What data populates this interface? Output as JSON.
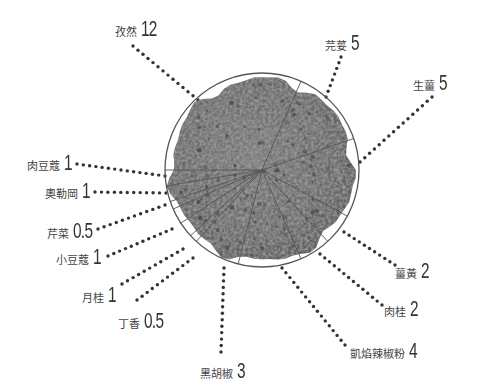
{
  "chart_data": {
    "type": "pie",
    "title": "",
    "center": [
      262,
      170
    ],
    "radius": 97,
    "start_angle_deg": 180,
    "direction": "clockwise",
    "colors": {
      "pile": "#6e6e6e",
      "pile_dark": "#4a4a4a",
      "pile_light": "#9a9a9a",
      "rim": "#555555",
      "dots": "#333333",
      "text": "#333333"
    },
    "slices": [
      {
        "name": "孜然",
        "value": 12,
        "value_label": "12"
      },
      {
        "name": "芫荽",
        "value": 5,
        "value_label": "5"
      },
      {
        "name": "生薑",
        "value": 5,
        "value_label": "5"
      },
      {
        "name": "薑黃",
        "value": 2,
        "value_label": "2"
      },
      {
        "name": "肉桂",
        "value": 2,
        "value_label": "2"
      },
      {
        "name": "凱焰辣椒粉",
        "value": 4,
        "value_label": "4"
      },
      {
        "name": "黑胡椒",
        "value": 3,
        "value_label": "3"
      },
      {
        "name": "丁香",
        "value": 0.5,
        "value_label": "0.5"
      },
      {
        "name": "月桂",
        "value": 1,
        "value_label": "1"
      },
      {
        "name": "小豆蔻",
        "value": 1,
        "value_label": "1"
      },
      {
        "name": "芹菜",
        "value": 0.5,
        "value_label": "0.5"
      },
      {
        "name": "奧勒岡",
        "value": 1,
        "value_label": "1"
      },
      {
        "name": "肉豆蔻",
        "value": 1,
        "value_label": "1"
      }
    ]
  },
  "labels": [
    {
      "key": "cumin",
      "name": "孜然",
      "value": "12",
      "x": 115,
      "y": 16,
      "anchor": "left",
      "leader": [
        [
          133,
          46
        ],
        [
          198,
          100
        ]
      ]
    },
    {
      "key": "coriander",
      "name": "芫荽",
      "value": "5",
      "x": 325,
      "y": 30,
      "anchor": "left",
      "leader": [
        [
          341,
          57
        ],
        [
          326,
          97
        ]
      ]
    },
    {
      "key": "ginger",
      "name": "生薑",
      "value": "5",
      "x": 413,
      "y": 70,
      "anchor": "left",
      "leader": [
        [
          432,
          97
        ],
        [
          360,
          162
        ]
      ]
    },
    {
      "key": "turmeric",
      "name": "薑黃",
      "value": "2",
      "x": 395,
      "y": 258,
      "anchor": "left",
      "leader": [
        [
          395,
          265
        ],
        [
          344,
          232
        ]
      ]
    },
    {
      "key": "cinnamon",
      "name": "肉桂",
      "value": "2",
      "x": 384,
      "y": 296,
      "anchor": "left",
      "leader": [
        [
          382,
          305
        ],
        [
          320,
          254
        ]
      ]
    },
    {
      "key": "cayenne",
      "name": "凱焰辣椒粉",
      "value": "4",
      "x": 350,
      "y": 338,
      "anchor": "left",
      "leader": [
        [
          345,
          345
        ],
        [
          282,
          268
        ]
      ]
    },
    {
      "key": "pepper",
      "name": "黑胡椒",
      "value": "3",
      "x": 200,
      "y": 358,
      "anchor": "left",
      "leader": [
        [
          221,
          352
        ],
        [
          224,
          268
        ]
      ]
    },
    {
      "key": "clove",
      "name": "丁香",
      "value": "0.5",
      "x": 118,
      "y": 308,
      "anchor": "left",
      "leader": [
        [
          137,
          300
        ],
        [
          193,
          258
        ]
      ]
    },
    {
      "key": "bay",
      "name": "月桂",
      "value": "1",
      "x": 82,
      "y": 282,
      "anchor": "left",
      "leader": [
        [
          122,
          284
        ],
        [
          183,
          249
        ]
      ]
    },
    {
      "key": "cardamom",
      "name": "小豆蔻",
      "value": "1",
      "x": 56,
      "y": 244,
      "anchor": "left",
      "leader": [
        [
          108,
          256
        ],
        [
          172,
          229
        ]
      ]
    },
    {
      "key": "celery",
      "name": "芹菜",
      "value": "0.5",
      "x": 47,
      "y": 218,
      "anchor": "left",
      "leader": [
        [
          98,
          229
        ],
        [
          165,
          205
        ]
      ]
    },
    {
      "key": "oregano",
      "name": "奧勒岡",
      "value": "1",
      "x": 45,
      "y": 178,
      "anchor": "left",
      "leader": [
        [
          95,
          192
        ],
        [
          166,
          193
        ]
      ]
    },
    {
      "key": "nutmeg",
      "name": "肉豆蔻",
      "value": "1",
      "x": 27,
      "y": 150,
      "anchor": "left",
      "leader": [
        [
          77,
          164
        ],
        [
          165,
          176
        ]
      ]
    }
  ]
}
